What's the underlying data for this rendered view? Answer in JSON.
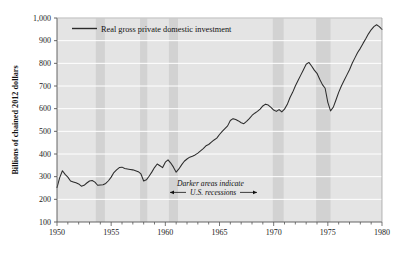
{
  "chart_data": {
    "type": "line",
    "title": "",
    "xlabel": "",
    "ylabel": "Billions of chained 2012 dollars",
    "xlim": [
      1950,
      1980
    ],
    "ylim": [
      100,
      1000
    ],
    "grid": true,
    "legend_position": "top-left-inside",
    "legend": [
      {
        "name": "Real gross private domestic investment",
        "color": "#2b2b2b"
      }
    ],
    "x_tick_labels": [
      "1950",
      "1955",
      "1960",
      "1965",
      "1970",
      "1975",
      "1980"
    ],
    "x_tick_values": [
      1950,
      1955,
      1960,
      1965,
      1970,
      1975,
      1980
    ],
    "x_minor_tick_interval": 1,
    "y_tick_labels": [
      "100",
      "200",
      "300",
      "400",
      "500",
      "600",
      "700",
      "800",
      "900",
      "1,000"
    ],
    "y_tick_values": [
      100,
      200,
      300,
      400,
      500,
      600,
      700,
      800,
      900,
      1000
    ],
    "annotations": [
      {
        "name": "recession-note",
        "line1": "Darker areas indicate",
        "line2": "U.S. recessions",
        "arrow_left": "←",
        "arrow_right": "→"
      }
    ],
    "shaded_bands": {
      "label": "U.S. recessions",
      "color": "#d2d2d2",
      "ranges": [
        [
          1953.58,
          1954.42
        ],
        [
          1957.67,
          1958.33
        ],
        [
          1960.33,
          1961.17
        ],
        [
          1969.92,
          1970.92
        ],
        [
          1973.92,
          1975.25
        ]
      ]
    },
    "series": [
      {
        "name": "Real gross private domestic investment",
        "color": "#2b2b2b",
        "x": [
          1950.0,
          1950.25,
          1950.5,
          1950.75,
          1951.0,
          1951.25,
          1951.5,
          1951.75,
          1952.0,
          1952.25,
          1952.5,
          1952.75,
          1953.0,
          1953.25,
          1953.5,
          1953.75,
          1954.0,
          1954.25,
          1954.5,
          1954.75,
          1955.0,
          1955.25,
          1955.5,
          1955.75,
          1956.0,
          1956.25,
          1956.5,
          1956.75,
          1957.0,
          1957.25,
          1957.5,
          1957.75,
          1958.0,
          1958.25,
          1958.5,
          1958.75,
          1959.0,
          1959.25,
          1959.5,
          1959.75,
          1960.0,
          1960.25,
          1960.5,
          1960.75,
          1961.0,
          1961.25,
          1961.5,
          1961.75,
          1962.0,
          1962.25,
          1962.5,
          1962.75,
          1963.0,
          1963.25,
          1963.5,
          1963.75,
          1964.0,
          1964.25,
          1964.5,
          1964.75,
          1965.0,
          1965.25,
          1965.5,
          1965.75,
          1966.0,
          1966.25,
          1966.5,
          1966.75,
          1967.0,
          1967.25,
          1967.5,
          1967.75,
          1968.0,
          1968.25,
          1968.5,
          1968.75,
          1969.0,
          1969.25,
          1969.5,
          1969.75,
          1970.0,
          1970.25,
          1970.5,
          1970.75,
          1971.0,
          1971.25,
          1971.5,
          1971.75,
          1972.0,
          1972.25,
          1972.5,
          1972.75,
          1973.0,
          1973.25,
          1973.5,
          1973.75,
          1974.0,
          1974.25,
          1974.5,
          1974.75,
          1975.0,
          1975.25,
          1975.5,
          1975.75,
          1976.0,
          1976.25,
          1976.5,
          1976.75,
          1977.0,
          1977.25,
          1977.5,
          1977.75,
          1978.0,
          1978.25,
          1978.5,
          1978.75,
          1979.0,
          1979.25,
          1979.5,
          1979.75,
          1980.0
        ],
        "y": [
          252,
          296,
          326,
          310,
          298,
          281,
          277,
          273,
          268,
          258,
          262,
          272,
          281,
          283,
          276,
          262,
          263,
          264,
          270,
          282,
          298,
          318,
          330,
          340,
          342,
          336,
          334,
          332,
          330,
          326,
          322,
          312,
          281,
          286,
          302,
          320,
          340,
          356,
          348,
          340,
          364,
          374,
          360,
          342,
          320,
          334,
          352,
          368,
          378,
          386,
          390,
          396,
          404,
          414,
          424,
          436,
          442,
          452,
          462,
          470,
          486,
          500,
          512,
          524,
          548,
          556,
          552,
          546,
          538,
          534,
          544,
          556,
          570,
          580,
          588,
          598,
          612,
          620,
          616,
          606,
          594,
          588,
          596,
          586,
          598,
          618,
          648,
          672,
          700,
          724,
          748,
          772,
          796,
          804,
          788,
          770,
          756,
          730,
          706,
          690,
          628,
          590,
          606,
          638,
          672,
          700,
          724,
          748,
          772,
          800,
          824,
          848,
          866,
          888,
          908,
          930,
          948,
          962,
          970,
          962,
          950
        ]
      }
    ]
  }
}
